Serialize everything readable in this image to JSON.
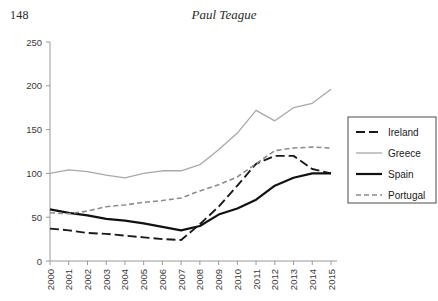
{
  "page": {
    "number": "148",
    "running_head": "Paul Teague"
  },
  "chart_data": {
    "type": "line",
    "title": "",
    "xlabel": "",
    "ylabel": "",
    "x": [
      2000,
      2001,
      2002,
      2003,
      2004,
      2005,
      2006,
      2007,
      2008,
      2009,
      2010,
      2011,
      2012,
      2013,
      2014,
      2015
    ],
    "categories": [
      "2000",
      "2001",
      "2002",
      "2003",
      "2004",
      "2005",
      "2006",
      "2007",
      "2008",
      "2009",
      "2010",
      "2011",
      "2012",
      "2013",
      "2014",
      "2015"
    ],
    "ylim": [
      0,
      250
    ],
    "yticks": [
      0,
      50,
      100,
      150,
      200,
      250
    ],
    "ytick_labels": [
      "0",
      "50",
      "100",
      "150",
      "200",
      "250"
    ],
    "xlim": [
      2000,
      2015
    ],
    "grid": false,
    "legend_position": "right",
    "series": [
      {
        "name": "Ireland",
        "color": "#1a1a1a",
        "style": "dashed",
        "dash": "9,4",
        "width": 1.9,
        "values": [
          37,
          35,
          32,
          31,
          29,
          27,
          25,
          24,
          42,
          62,
          86,
          111,
          120,
          120,
          105,
          100
        ]
      },
      {
        "name": "Greece",
        "color": "#a8a8a8",
        "style": "solid",
        "dash": "",
        "width": 1.3,
        "values": [
          100,
          104,
          102,
          98,
          95,
          100,
          103,
          103,
          110,
          127,
          146,
          172,
          160,
          175,
          180,
          196
        ]
      },
      {
        "name": "Spain",
        "color": "#111111",
        "style": "solid",
        "dash": "",
        "width": 2.2,
        "values": [
          59,
          55,
          52,
          48,
          46,
          43,
          39,
          35,
          40,
          53,
          60,
          70,
          86,
          95,
          100,
          100
        ]
      },
      {
        "name": "Portugal",
        "color": "#8c8c8c",
        "style": "dashed",
        "dash": "5,3",
        "width": 1.6,
        "values": [
          55,
          54,
          57,
          62,
          64,
          67,
          69,
          72,
          80,
          87,
          96,
          111,
          126,
          129,
          130,
          129
        ]
      }
    ]
  }
}
